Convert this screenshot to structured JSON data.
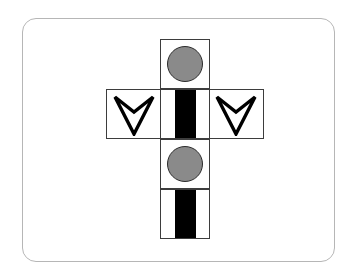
{
  "figure": {
    "frame": {
      "shape": "rounded-rectangle",
      "border_color": "#b6b6b6",
      "background_color": "#ffffff"
    },
    "colors": {
      "outline": "#3d3d3d",
      "disc_fill": "#8a8a8a",
      "disc_outline": "#2c2c2c",
      "stripe_fill": "#000000",
      "face_background": "#ffffff",
      "chevron_stroke": "#000000"
    },
    "grid": {
      "rows": 4,
      "columns": 3,
      "cell_size_px": 50
    },
    "faces": [
      {
        "id": "top",
        "name": "top-face",
        "row": 1,
        "column": 2,
        "symbol": "gray-circle",
        "symbol_label": "Gray filled circle"
      },
      {
        "id": "left",
        "name": "left-face",
        "row": 2,
        "column": 1,
        "symbol": "down-chevron",
        "symbol_label": "Downward chevron outline"
      },
      {
        "id": "center",
        "name": "center-face",
        "row": 2,
        "column": 2,
        "symbol": "black-stripe",
        "symbol_label": "Vertical black stripe"
      },
      {
        "id": "right",
        "name": "right-face",
        "row": 2,
        "column": 3,
        "symbol": "down-chevron",
        "symbol_label": "Downward chevron outline"
      },
      {
        "id": "lower-middle",
        "name": "lower-middle-face",
        "row": 3,
        "column": 2,
        "symbol": "gray-circle",
        "symbol_label": "Gray filled circle"
      },
      {
        "id": "bottom",
        "name": "bottom-face",
        "row": 4,
        "column": 2,
        "symbol": "black-stripe",
        "symbol_label": "Vertical black stripe"
      }
    ]
  }
}
